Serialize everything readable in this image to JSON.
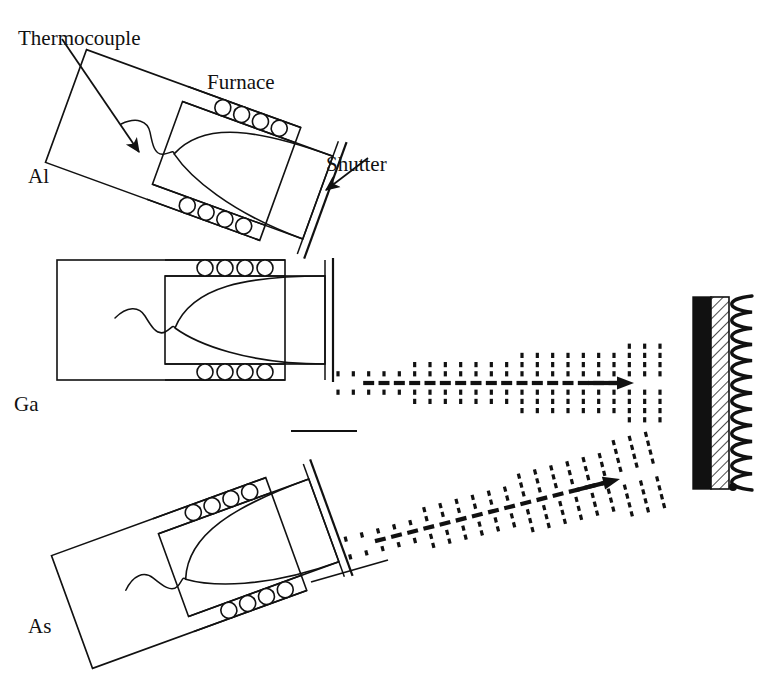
{
  "figure": {
    "type": "diagram",
    "background": "#ffffff",
    "ink": "#111111",
    "width": 775,
    "height": 678
  },
  "labels": [
    {
      "id": "thermocouple",
      "text": "Thermocouple",
      "x": 18,
      "y": 24,
      "anchor": "start",
      "size": 21
    },
    {
      "id": "furnace",
      "text": "Furnace",
      "x": 207,
      "y": 68,
      "anchor": "start",
      "size": 21
    },
    {
      "id": "shutter",
      "text": "Shutter",
      "x": 326,
      "y": 150,
      "anchor": "start",
      "size": 21
    },
    {
      "id": "al",
      "text": "Al",
      "x": 28,
      "y": 162,
      "anchor": "start",
      "size": 21
    },
    {
      "id": "ga",
      "text": "Ga",
      "x": 14,
      "y": 390,
      "anchor": "start",
      "size": 21
    },
    {
      "id": "as",
      "text": "As",
      "x": 28,
      "y": 612,
      "anchor": "start",
      "size": 21
    }
  ],
  "cells": [
    {
      "id": "al-cell",
      "name": "Al effusion cell",
      "element": "Al",
      "rotation_deg": 20,
      "pivot_x": 190,
      "pivot_y": 180,
      "heater_circles_top": 4,
      "heater_circles_bottom": 4,
      "has_thermocouple": true,
      "has_shutter": true
    },
    {
      "id": "ga-cell",
      "name": "Ga effusion cell",
      "element": "Ga",
      "rotation_deg": 0,
      "pivot_x": 170,
      "pivot_y": 390,
      "heater_circles_top": 4,
      "heater_circles_bottom": 4,
      "has_thermocouple": true,
      "has_shutter": true
    },
    {
      "id": "as-cell",
      "name": "As effusion cell",
      "element": "As",
      "rotation_deg": -20,
      "pivot_x": 190,
      "pivot_y": 585,
      "heater_circles_top": 4,
      "heater_circles_bottom": 4,
      "has_thermocouple": true,
      "has_shutter": true
    }
  ],
  "beams": [
    {
      "id": "ga-beam",
      "name": "Ga molecular beam",
      "source": "Ga",
      "direction": "horizontal",
      "angle_deg": 0,
      "x_start": 338,
      "x_end": 660,
      "y": 383,
      "arrow_tip_x": 634,
      "dash_columns": 22,
      "style": "dashed-cone-with-axis-arrow"
    },
    {
      "id": "as-beam",
      "name": "As molecular beam",
      "source": "As",
      "direction": "diagonal-up-right",
      "angle_deg": -13,
      "x_start": 348,
      "x_end": 655,
      "y_start": 548,
      "y_end": 470,
      "arrow_tip_x": 620,
      "dash_columns": 20,
      "style": "dashed-cone-with-axis-arrow"
    }
  ],
  "substrate": {
    "id": "substrate-assembly",
    "name": "Substrate and heater",
    "black_bar": {
      "x": 693,
      "y": 297,
      "width": 18,
      "height": 192,
      "fill": "#111111"
    },
    "hatched_bar": {
      "x": 711,
      "y": 297,
      "width": 18,
      "height": 192,
      "pattern": "diagonal-hatch"
    },
    "heater_coil": {
      "x": 736,
      "y": 296,
      "height": 194,
      "loops": 12
    },
    "terminal_dot": {
      "x": 733,
      "y": 487,
      "r": 4
    }
  },
  "leaders": [
    {
      "id": "thermocouple-arrow",
      "name": "thermocouple pointer",
      "x1": 62,
      "y1": 39,
      "x2": 141,
      "y2": 156,
      "arrowhead": true
    },
    {
      "id": "shutter-arrow",
      "name": "shutter pointer",
      "x1": 363,
      "y1": 160,
      "x2": 324,
      "y2": 192,
      "arrowhead": true
    },
    {
      "id": "ga-beam-leader",
      "name": "Ga cell beam leader",
      "x1": 291,
      "y1": 431,
      "x2": 357,
      "y2": 431,
      "arrowhead": false
    },
    {
      "id": "as-beam-leader",
      "name": "As cell beam leader",
      "x1": 313,
      "y1": 581,
      "x2": 386,
      "y2": 561,
      "arrowhead": false
    }
  ]
}
